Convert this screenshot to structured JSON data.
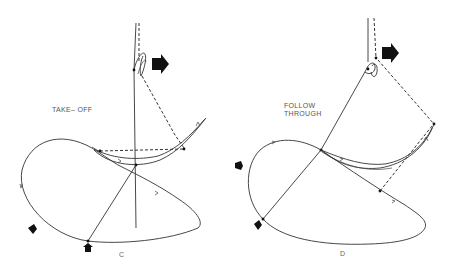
{
  "panels": [
    {
      "id": "C",
      "letter": "C",
      "caption_lines": [
        "TAKE– OFF"
      ],
      "direction_arrow": "right-arrow",
      "force_arrows": [
        "small-arrow-lower-left",
        "small-arrow-bottom"
      ]
    },
    {
      "id": "D",
      "letter": "D",
      "caption_lines": [
        "FOLLOW",
        "THROUGH"
      ],
      "direction_arrow": "right-arrow",
      "force_arrows": [
        "small-arrow-left",
        "small-arrow-lower-left"
      ]
    }
  ],
  "colors": {
    "line": "#333333",
    "arrow": "#111111",
    "text": "#555555",
    "background": "#ffffff"
  }
}
